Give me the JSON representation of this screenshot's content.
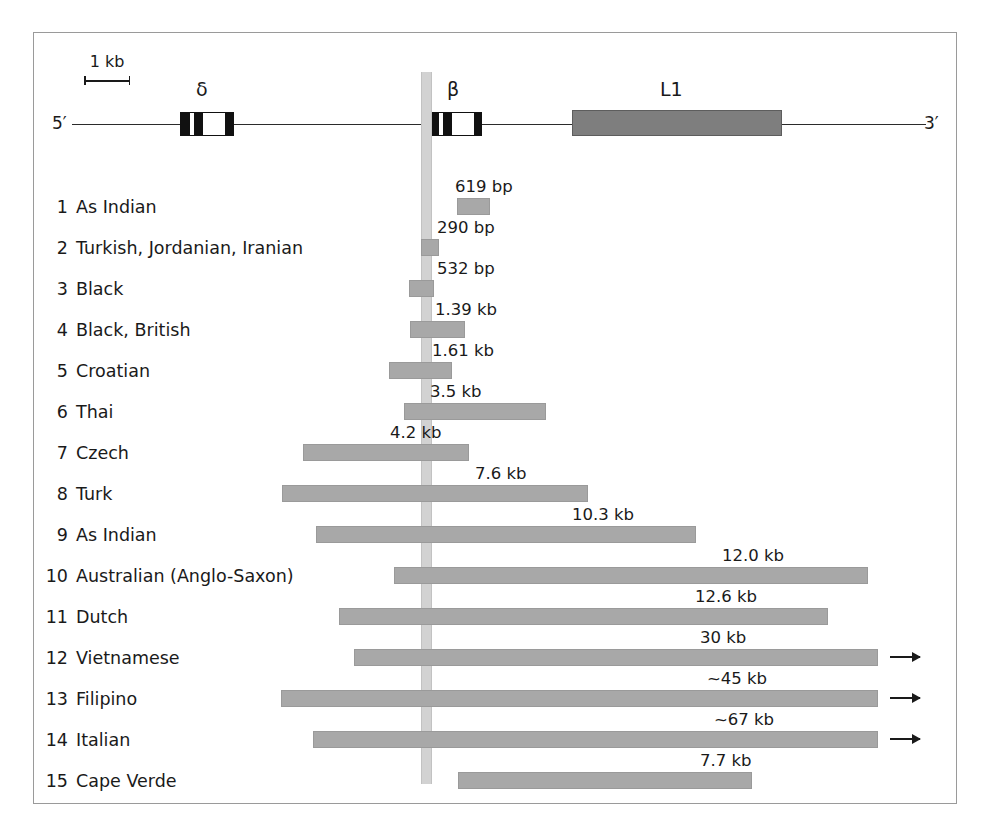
{
  "figure": {
    "scale": {
      "label": "1 kb"
    },
    "map": {
      "five_prime": "5′",
      "three_prime": "3′",
      "delta_symbol": "δ",
      "beta_symbol": "β",
      "l1_symbol": "L1"
    }
  },
  "chart_data": {
    "type": "bar",
    "title": "",
    "xlabel": "",
    "ylabel": "",
    "legend": [],
    "grid": false,
    "axis_note": "Horizontal genomic coordinate; bars are deletion extents relative to the beta-globin gene (vertical grey reference line).",
    "categories": [
      "As Indian",
      "Turkish, Jordanian, Iranian",
      "Black",
      "Black, British",
      "Croatian",
      "Thai",
      "Czech",
      "Turk",
      "As Indian",
      "Australian (Anglo-Saxon)",
      "Dutch",
      "Vietnamese",
      "Filipino",
      "Italian",
      "Cape Verde"
    ],
    "value_labels": [
      "619 bp",
      "290 bp",
      "532 bp",
      "1.39 kb",
      "1.61 kb",
      "3.5 kb",
      "4.2 kb",
      "7.6 kb",
      "10.3 kb",
      "12.0 kb",
      "12.6 kb",
      "30 kb",
      "~45 kb",
      "~67 kb",
      "7.7 kb"
    ],
    "values_kb": [
      0.619,
      0.29,
      0.532,
      1.39,
      1.61,
      3.5,
      4.2,
      7.6,
      10.3,
      12.0,
      12.6,
      30,
      45,
      67,
      7.7
    ],
    "continues_offscreen": [
      false,
      false,
      false,
      false,
      false,
      false,
      false,
      false,
      false,
      false,
      false,
      true,
      true,
      true,
      false
    ]
  },
  "rows": [
    {
      "num": "1",
      "label": "As Indian",
      "size": "619 bp",
      "bar_left": 457,
      "bar_width": 33,
      "label_left": 455,
      "arrow": false
    },
    {
      "num": "2",
      "label": "Turkish, Jordanian, Iranian",
      "size": "290 bp",
      "bar_left": 421,
      "bar_width": 18,
      "label_left": 437,
      "arrow": false
    },
    {
      "num": "3",
      "label": "Black",
      "size": "532 bp",
      "bar_left": 409,
      "bar_width": 25,
      "label_left": 437,
      "arrow": false
    },
    {
      "num": "4",
      "label": "Black, British",
      "size": "1.39 kb",
      "bar_left": 410,
      "bar_width": 55,
      "label_left": 435,
      "arrow": false
    },
    {
      "num": "5",
      "label": "Croatian",
      "size": "1.61 kb",
      "bar_left": 389,
      "bar_width": 63,
      "label_left": 432,
      "arrow": false
    },
    {
      "num": "6",
      "label": "Thai",
      "size": "3.5 kb",
      "bar_left": 404,
      "bar_width": 142,
      "label_left": 430,
      "arrow": false
    },
    {
      "num": "7",
      "label": "Czech",
      "size": "4.2 kb",
      "bar_left": 303,
      "bar_width": 166,
      "label_left": 390,
      "arrow": false
    },
    {
      "num": "8",
      "label": "Turk",
      "size": "7.6 kb",
      "bar_left": 282,
      "bar_width": 306,
      "label_left": 475,
      "arrow": false
    },
    {
      "num": "9",
      "label": "As Indian",
      "size": "10.3 kb",
      "bar_left": 316,
      "bar_width": 380,
      "label_left": 572,
      "arrow": false
    },
    {
      "num": "10",
      "label": "Australian (Anglo-Saxon)",
      "size": "12.0 kb",
      "bar_left": 394,
      "bar_width": 474,
      "label_left": 722,
      "arrow": false
    },
    {
      "num": "11",
      "label": "Dutch",
      "size": "12.6 kb",
      "bar_left": 339,
      "bar_width": 489,
      "label_left": 695,
      "arrow": false
    },
    {
      "num": "12",
      "label": "Vietnamese",
      "size": "30 kb",
      "bar_left": 354,
      "bar_width": 524,
      "label_left": 700,
      "arrow": true
    },
    {
      "num": "13",
      "label": "Filipino",
      "size": "~45 kb",
      "bar_left": 281,
      "bar_width": 597,
      "label_left": 707,
      "arrow": true
    },
    {
      "num": "14",
      "label": "Italian",
      "size": "~67 kb",
      "bar_left": 313,
      "bar_width": 565,
      "label_left": 714,
      "arrow": true
    },
    {
      "num": "15",
      "label": "Cape Verde",
      "size": "7.7 kb",
      "bar_left": 458,
      "bar_width": 294,
      "label_left": 700,
      "arrow": false
    }
  ]
}
